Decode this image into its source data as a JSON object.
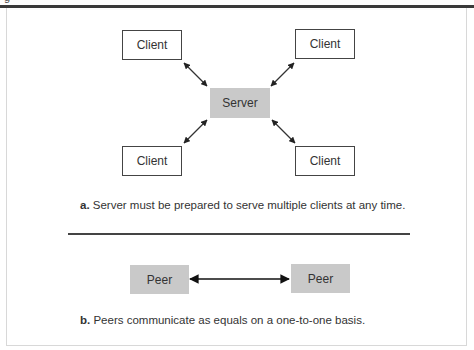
{
  "figure": {
    "clipped_title": "g"
  },
  "panel_a": {
    "server_label": "Server",
    "clients": [
      "Client",
      "Client",
      "Client",
      "Client"
    ],
    "caption_letter": "a.",
    "caption_text": " Server must be prepared to serve multiple clients at any time."
  },
  "panel_b": {
    "peers": [
      "Peer",
      "Peer"
    ],
    "caption_letter": "b.",
    "caption_text": " Peers communicate as equals on a one-to-one basis."
  },
  "colors": {
    "server_fill": "#c9c9c9",
    "peer_fill": "#c9c9c9",
    "rule": "#3a3a3a",
    "box_border": "#444444"
  }
}
